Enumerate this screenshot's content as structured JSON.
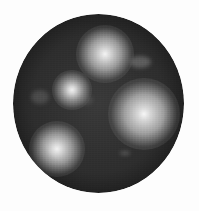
{
  "image": {
    "width": 199,
    "height": 211,
    "background": "#fdfdfd",
    "description": "Grayscale dark circular disc with four bright diffuse glowing spots"
  },
  "disc": {
    "left": 13,
    "top": 14,
    "width": 171,
    "height": 179,
    "color_center": "#3a3a3a",
    "color_edge": "#1c1c1c"
  },
  "spots": [
    {
      "name": "top",
      "cx": 105,
      "cy": 54,
      "size": 58,
      "core": "#f4f4f4",
      "mid": "#9a9a9a"
    },
    {
      "name": "left-middle",
      "cx": 72,
      "cy": 90,
      "size": 40,
      "core": "#f0f0f0",
      "mid": "#8c8c8c"
    },
    {
      "name": "right",
      "cx": 144,
      "cy": 114,
      "size": 72,
      "core": "#f7f7f7",
      "mid": "#a0a0a0"
    },
    {
      "name": "bottom-left",
      "cx": 57,
      "cy": 149,
      "size": 56,
      "core": "#f2f2f2",
      "mid": "#979797"
    }
  ],
  "smudges": [
    {
      "name": "upper-right-smudge",
      "cx": 140,
      "cy": 62,
      "w": 22,
      "h": 12,
      "color": "rgba(150,150,150,0.45)"
    },
    {
      "name": "left-smudge",
      "cx": 40,
      "cy": 97,
      "w": 18,
      "h": 14,
      "color": "rgba(130,130,130,0.35)"
    },
    {
      "name": "center-smudge",
      "cx": 86,
      "cy": 100,
      "w": 14,
      "h": 10,
      "color": "rgba(120,120,120,0.3)"
    },
    {
      "name": "bottom-streak",
      "cx": 125,
      "cy": 153,
      "w": 10,
      "h": 3,
      "color": "rgba(170,170,170,0.45)"
    }
  ]
}
